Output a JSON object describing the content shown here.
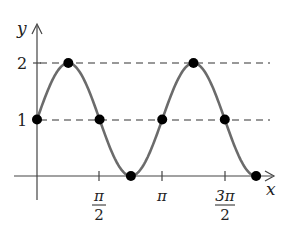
{
  "chart_data": {
    "type": "line",
    "title": "",
    "function": "y = 1 + sin(2x)",
    "xlabel": "x",
    "ylabel": "y",
    "x_ticks": [
      {
        "value": 1.5708,
        "label_num": "π",
        "label_den": "2"
      },
      {
        "value": 3.1416,
        "label_num": "π",
        "label_den": ""
      },
      {
        "value": 4.7124,
        "label_num": "3π",
        "label_den": "2"
      }
    ],
    "y_ticks": [
      {
        "value": 1,
        "label": "1"
      },
      {
        "value": 2,
        "label": "2"
      }
    ],
    "reference_lines": [
      {
        "y": 1,
        "style": "dashed"
      },
      {
        "y": 2,
        "style": "dashed"
      }
    ],
    "xlim": [
      0,
      5.5
    ],
    "ylim": [
      0,
      2
    ],
    "grid": false,
    "points": [
      {
        "x": 0,
        "y": 1
      },
      {
        "x": 0.7854,
        "y": 2
      },
      {
        "x": 1.5708,
        "y": 1
      },
      {
        "x": 2.3562,
        "y": 0
      },
      {
        "x": 3.1416,
        "y": 1
      },
      {
        "x": 3.927,
        "y": 2
      },
      {
        "x": 4.7124,
        "y": 1
      },
      {
        "x": 5.4978,
        "y": 0
      }
    ],
    "colors": {
      "curve": "#6b6b6b",
      "points": "#000000",
      "axes": "#444444",
      "dashed": "#777777"
    }
  },
  "labels": {
    "y_axis": "y",
    "x_axis": "x",
    "tick_y2": "2",
    "tick_y1": "1",
    "tick_pi_half_num": "π",
    "tick_pi_half_den": "2",
    "tick_pi": "π",
    "tick_3pi_half_num": "3π",
    "tick_3pi_half_den": "2"
  }
}
